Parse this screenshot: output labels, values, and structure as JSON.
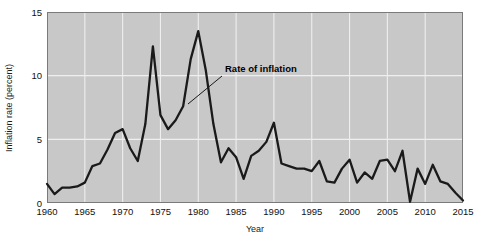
{
  "chart_data": {
    "type": "line",
    "title": "",
    "xlabel": "Year",
    "ylabel": "Inflation rate (percent)",
    "xlim": [
      1960,
      2015
    ],
    "ylim": [
      0,
      15
    ],
    "xticks": [
      1960,
      1965,
      1970,
      1975,
      1980,
      1985,
      1990,
      1995,
      2000,
      2005,
      2010,
      2015
    ],
    "yticks": [
      0,
      5,
      10,
      15
    ],
    "grid": true,
    "legend_position": "none",
    "annotations": [
      {
        "text": "Rate of inflation",
        "label_x": 225,
        "label_y": 72,
        "leader_from_x": 222,
        "leader_from_y": 76,
        "leader_to_x": 188,
        "leader_to_y": 104
      }
    ],
    "series": [
      {
        "name": "Rate of inflation",
        "color": "#1a1a1a",
        "x": [
          1960,
          1961,
          1962,
          1963,
          1964,
          1965,
          1966,
          1967,
          1968,
          1969,
          1970,
          1971,
          1972,
          1973,
          1974,
          1975,
          1976,
          1977,
          1978,
          1979,
          1980,
          1981,
          1982,
          1983,
          1984,
          1985,
          1986,
          1987,
          1988,
          1989,
          1990,
          1991,
          1992,
          1993,
          1994,
          1995,
          1996,
          1997,
          1998,
          1999,
          2000,
          2001,
          2002,
          2003,
          2004,
          2005,
          2006,
          2007,
          2008,
          2009,
          2010,
          2011,
          2012,
          2013,
          2014,
          2015
        ],
        "values": [
          1.5,
          0.7,
          1.2,
          1.2,
          1.3,
          1.6,
          2.9,
          3.1,
          4.2,
          5.5,
          5.8,
          4.3,
          3.3,
          6.2,
          12.3,
          6.9,
          5.8,
          6.5,
          7.6,
          11.3,
          13.5,
          10.4,
          6.2,
          3.2,
          4.3,
          3.6,
          1.9,
          3.7,
          4.1,
          4.8,
          6.3,
          3.1,
          2.9,
          2.7,
          2.7,
          2.5,
          3.3,
          1.7,
          1.6,
          2.7,
          3.4,
          1.6,
          2.4,
          1.9,
          3.3,
          3.4,
          2.5,
          4.1,
          0.1,
          2.7,
          1.5,
          3.0,
          1.7,
          1.5,
          0.8,
          0.2
        ]
      }
    ]
  }
}
